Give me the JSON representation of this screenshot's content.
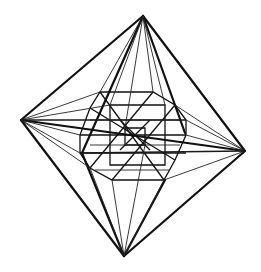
{
  "figure": {
    "colors": {
      "background": "#ffffff",
      "stroke": "#111111"
    },
    "vertices": {
      "top": [
        143,
        16
      ],
      "left": [
        21,
        120
      ],
      "right": [
        245,
        151
      ],
      "bottom": [
        124,
        256
      ]
    }
  }
}
